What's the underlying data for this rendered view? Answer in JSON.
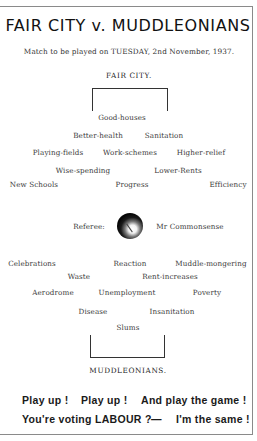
{
  "header": {
    "title": "FAIR CITY v. MUDDLEONIANS",
    "subtitle": "Match to be played on TUESDAY, 2nd November, 1937.",
    "home_team": "FAIR CITY."
  },
  "fair_city_players": {
    "row1": [
      "Good-houses"
    ],
    "row2": [
      "Better-health",
      "Sanitation"
    ],
    "row3": [
      "Playing-fields",
      "Work-schemes",
      "Higher-relief"
    ],
    "row4": [
      "Wise-spending",
      "Lower-Rents"
    ],
    "row5": [
      "New Schools",
      "Progress",
      "Efficiency"
    ]
  },
  "referee": {
    "label": "Referee:",
    "name": "Mr Commonsense",
    "icon": "football-icon"
  },
  "muddleonians_players": {
    "row1": [
      "Celebrations",
      "Reaction",
      "Muddle-mongering"
    ],
    "row2": [
      "Waste",
      "Rent-increases"
    ],
    "row3": [
      "Aerodrome",
      "Unemployment",
      "Poverty"
    ],
    "row4": [
      "Disease",
      "Insanitation"
    ],
    "row5": [
      "Slums"
    ]
  },
  "away_team": "MUDDLEONIANS.",
  "slogan": {
    "line1": [
      "Play up !",
      "Play up !",
      "And play the game !"
    ],
    "line2": [
      "You're voting LABOUR ?",
      "—",
      "I'm the same !"
    ]
  }
}
